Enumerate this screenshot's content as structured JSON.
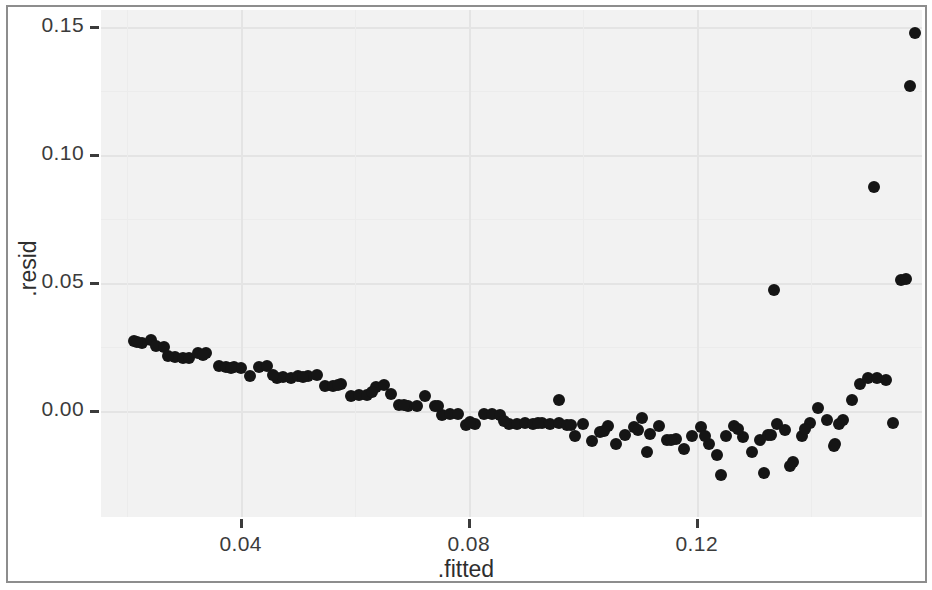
{
  "figure": {
    "width": 932,
    "height": 590,
    "background": "#ffffff",
    "panel_background": "#f2f2f2",
    "point_color": "#151515",
    "gridline_color": "#e4e4e4",
    "axis_text_color": "#3b3b3b"
  },
  "chart_data": {
    "type": "scatter",
    "title": "",
    "subtitle": "",
    "xlabel": ".fitted",
    "ylabel": ".resid",
    "xlim": [
      0.0155,
      0.1595
    ],
    "ylim": [
      -0.0415,
      0.1565
    ],
    "xticks": [
      0.04,
      0.08,
      0.12
    ],
    "xtick_labels": [
      "0.04",
      "0.08",
      "0.12"
    ],
    "yticks": [
      0.0,
      0.05,
      0.1,
      0.15
    ],
    "ytick_labels": [
      "0.00",
      "0.05",
      "0.10",
      "0.15"
    ],
    "grid": true,
    "legend": "none",
    "marker": "filled-circle",
    "marker_size_px": 12,
    "n_points": 124,
    "points": [
      [
        0.0213,
        0.0272
      ],
      [
        0.0227,
        0.0263
      ],
      [
        0.0243,
        0.0278
      ],
      [
        0.0252,
        0.0251
      ],
      [
        0.0266,
        0.0247
      ],
      [
        0.0285,
        0.0208
      ],
      [
        0.0298,
        0.0205
      ],
      [
        0.031,
        0.0207
      ],
      [
        0.0325,
        0.0226
      ],
      [
        0.034,
        0.0224
      ],
      [
        0.0362,
        0.0176
      ],
      [
        0.0375,
        0.017
      ],
      [
        0.0389,
        0.0172
      ],
      [
        0.04,
        0.0168
      ],
      [
        0.0417,
        0.0136
      ],
      [
        0.0432,
        0.0172
      ],
      [
        0.0447,
        0.0175
      ],
      [
        0.0463,
        0.0128
      ],
      [
        0.0475,
        0.0131
      ],
      [
        0.0488,
        0.0128
      ],
      [
        0.0501,
        0.0135
      ],
      [
        0.0518,
        0.0135
      ],
      [
        0.0533,
        0.0138
      ],
      [
        0.0548,
        0.0097
      ],
      [
        0.0562,
        0.0096
      ],
      [
        0.0576,
        0.0103
      ],
      [
        0.0594,
        0.0056
      ],
      [
        0.0608,
        0.0062
      ],
      [
        0.0621,
        0.006
      ],
      [
        0.0637,
        0.0093
      ],
      [
        0.0651,
        0.0102
      ],
      [
        0.0664,
        0.0066
      ],
      [
        0.0677,
        0.0023
      ],
      [
        0.0693,
        0.0019
      ],
      [
        0.0709,
        0.002
      ],
      [
        0.0723,
        0.0058
      ],
      [
        0.074,
        0.0018
      ],
      [
        0.0753,
        -0.0016
      ],
      [
        0.0768,
        -0.0011
      ],
      [
        0.0781,
        -0.0013
      ],
      [
        0.0795,
        -0.0055
      ],
      [
        0.0811,
        -0.0052
      ],
      [
        0.0826,
        -0.0012
      ],
      [
        0.084,
        -0.0013
      ],
      [
        0.0855,
        -0.0017
      ],
      [
        0.087,
        -0.005
      ],
      [
        0.0885,
        -0.0051
      ],
      [
        0.0899,
        -0.0047
      ],
      [
        0.0913,
        -0.005
      ],
      [
        0.0928,
        -0.0047
      ],
      [
        0.0943,
        -0.0053
      ],
      [
        0.0958,
        -0.0049
      ],
      [
        0.0972,
        -0.0055
      ],
      [
        0.0986,
        -0.0099
      ],
      [
        0.1001,
        -0.0051
      ],
      [
        0.1016,
        -0.012
      ],
      [
        0.1031,
        -0.0084
      ],
      [
        0.1045,
        -0.006
      ],
      [
        0.1059,
        -0.0128
      ],
      [
        0.1074,
        -0.0093
      ],
      [
        0.1089,
        -0.0063
      ],
      [
        0.1104,
        -0.0027
      ],
      [
        0.1118,
        -0.009
      ],
      [
        0.1133,
        -0.006
      ],
      [
        0.1148,
        -0.0115
      ],
      [
        0.1163,
        -0.0112
      ],
      [
        0.1178,
        -0.0149
      ],
      [
        0.1192,
        -0.0098
      ],
      [
        0.1207,
        -0.0065
      ],
      [
        0.1222,
        -0.0129
      ],
      [
        0.1236,
        -0.0172
      ],
      [
        0.1251,
        -0.0098
      ],
      [
        0.1266,
        -0.0061
      ],
      [
        0.1281,
        -0.0103
      ],
      [
        0.1296,
        -0.0162
      ],
      [
        0.131,
        -0.0113
      ],
      [
        0.1325,
        -0.0094
      ],
      [
        0.134,
        -0.0053
      ],
      [
        0.1355,
        -0.0075
      ],
      [
        0.1369,
        -0.0201
      ],
      [
        0.1384,
        -0.01
      ],
      [
        0.1399,
        -0.0048
      ],
      [
        0.1413,
        0.0012
      ],
      [
        0.1428,
        -0.0037
      ],
      [
        0.1442,
        -0.013
      ],
      [
        0.1457,
        -0.0035
      ],
      [
        0.1336,
        0.0472
      ],
      [
        0.1472,
        0.004
      ],
      [
        0.1487,
        0.0103
      ],
      [
        0.1501,
        0.0126
      ],
      [
        0.1516,
        0.0127
      ],
      [
        0.1531,
        0.012
      ],
      [
        0.1545,
        -0.0049
      ],
      [
        0.151,
        0.0873
      ],
      [
        0.1559,
        0.051
      ],
      [
        0.1567,
        0.0515
      ],
      [
        0.1574,
        0.127
      ],
      [
        0.1583,
        0.1475
      ],
      [
        0.0218,
        0.0268
      ],
      [
        0.0272,
        0.0215
      ],
      [
        0.0334,
        0.0218
      ],
      [
        0.0383,
        0.0168
      ],
      [
        0.0456,
        0.014
      ],
      [
        0.051,
        0.0133
      ],
      [
        0.057,
        0.01
      ],
      [
        0.063,
        0.0074
      ],
      [
        0.0686,
        0.0023
      ],
      [
        0.0746,
        0.002
      ],
      [
        0.0802,
        -0.0043
      ],
      [
        0.0862,
        -0.004
      ],
      [
        0.0921,
        -0.0048
      ],
      [
        0.0979,
        -0.0056
      ],
      [
        0.1038,
        -0.0079
      ],
      [
        0.1096,
        -0.0075
      ],
      [
        0.1155,
        -0.0113
      ],
      [
        0.1214,
        -0.01
      ],
      [
        0.1272,
        -0.007
      ],
      [
        0.1331,
        -0.0096
      ],
      [
        0.139,
        -0.0073
      ],
      [
        0.1449,
        -0.0052
      ],
      [
        0.0958,
        0.0043
      ],
      [
        0.1112,
        -0.0162
      ],
      [
        0.1243,
        -0.025
      ],
      [
        0.1318,
        -0.0245
      ],
      [
        0.1363,
        -0.0215
      ],
      [
        0.144,
        -0.0138
      ]
    ]
  }
}
